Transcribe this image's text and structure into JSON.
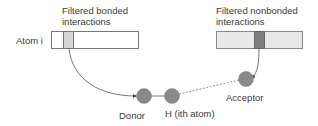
{
  "labels": {
    "bonded_title_line1": "Filtered bonded",
    "bonded_title_line2": "interactions",
    "nonbonded_title_line1": "Filtered nonbonded",
    "nonbonded_title_line2": "interactions",
    "atom_i": "Atom i",
    "donor": "Donor",
    "hydrogen": "H (ith atom)",
    "acceptor": "Acceptor"
  },
  "colors": {
    "bar_fill_left": "#ffffff",
    "bar_fill_right": "#e8e8e8",
    "bonded_segment": "#d4d4d4",
    "nonbonded_segment": "#7d7d7d",
    "atom_circle": "#8a8a8a",
    "line": "#555555"
  }
}
